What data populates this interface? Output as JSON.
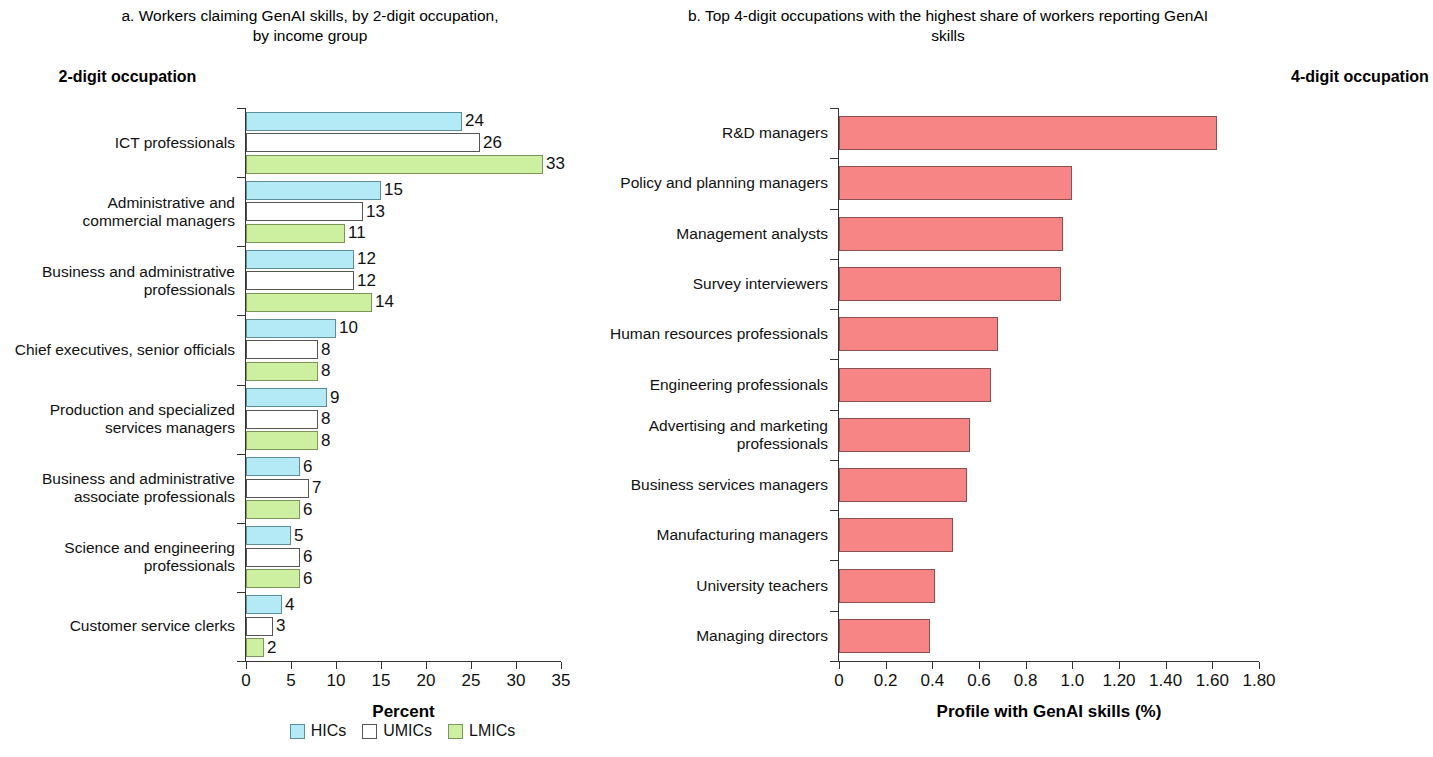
{
  "panel_a": {
    "title": "a. Workers claiming GenAI skills, by 2-digit occupation, by income group",
    "axis_heading": "2-digit occupation",
    "xlabel": "Percent",
    "legend": [
      {
        "label": "HICs",
        "color": "#b4eaf5"
      },
      {
        "label": "UMICs",
        "color": "#ffffff"
      },
      {
        "label": "LMICs",
        "color": "#cdf0a0"
      }
    ]
  },
  "panel_b": {
    "title": "b. Top 4-digit occupations with the highest share of workers reporting GenAI skills",
    "axis_heading": "4-digit occupation",
    "xlabel": "Profile with GenAI skills (%)",
    "bar_color": "#f78585"
  },
  "chart_data": [
    {
      "type": "bar",
      "orientation": "horizontal",
      "panel": "a",
      "title": "a. Workers claiming GenAI skills, by 2-digit occupation, by income group",
      "xlabel": "Percent",
      "ylabel": "2-digit occupation",
      "xlim": [
        0,
        35
      ],
      "xticks": [
        0,
        5,
        10,
        15,
        20,
        25,
        30,
        35
      ],
      "xticklabels": [
        "0",
        "5",
        "10",
        "15",
        "20",
        "25",
        "30",
        "35"
      ],
      "grid": false,
      "legend_position": "bottom",
      "categories": [
        "ICT professionals",
        "Administrative and\ncommercial managers",
        "Business and administrative\nprofessionals",
        "Chief executives, senior officials",
        "Production and specialized\nservices managers",
        "Business and administrative\nassociate professionals",
        "Science and engineering\nprofessionals",
        "Customer service clerks"
      ],
      "series": [
        {
          "name": "HICs",
          "color": "#b4eaf5",
          "values": [
            24,
            15,
            12,
            10,
            9,
            6,
            5,
            4
          ]
        },
        {
          "name": "UMICs",
          "color": "#ffffff",
          "values": [
            26,
            13,
            12,
            8,
            8,
            7,
            6,
            3
          ]
        },
        {
          "name": "LMICs",
          "color": "#cdf0a0",
          "values": [
            33,
            11,
            14,
            8,
            8,
            6,
            6,
            2
          ]
        }
      ]
    },
    {
      "type": "bar",
      "orientation": "horizontal",
      "panel": "b",
      "title": "b. Top 4-digit occupations with the highest share of workers reporting GenAI skills",
      "xlabel": "Profile with GenAI skills (%)",
      "ylabel": "4-digit occupation",
      "xlim": [
        0,
        1.8
      ],
      "xticks": [
        0,
        0.2,
        0.4,
        0.6,
        0.8,
        1.0,
        1.2,
        1.4,
        1.6,
        1.8
      ],
      "xticklabels": [
        "0",
        "0.2",
        "0.4",
        "0.6",
        "0.8",
        "1.0",
        "1.20",
        "1.40",
        "1.60",
        "1.80"
      ],
      "grid": false,
      "legend_position": "none",
      "categories": [
        "R&D managers",
        "Policy and planning managers",
        "Management analysts",
        "Survey interviewers",
        "Human resources professionals",
        "Engineering professionals",
        "Advertising and marketing\nprofessionals",
        "Business services managers",
        "Manufacturing managers",
        "University teachers",
        "Managing directors"
      ],
      "values": [
        1.62,
        1.0,
        0.96,
        0.95,
        0.68,
        0.65,
        0.56,
        0.55,
        0.49,
        0.41,
        0.39
      ],
      "color": "#f78585"
    }
  ]
}
